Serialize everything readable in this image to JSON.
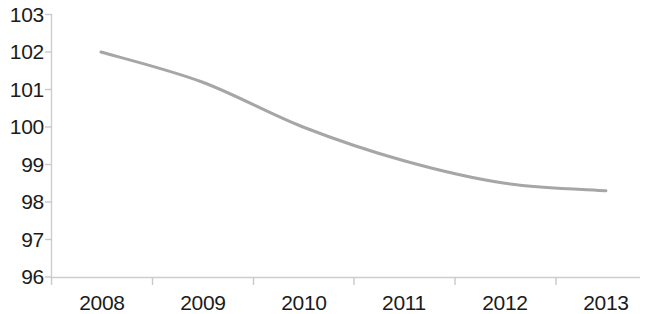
{
  "chart_data": {
    "type": "line",
    "title": "",
    "subtitle": "",
    "xlabel": "",
    "ylabel": "",
    "x": [
      "2008",
      "2009",
      "2010",
      "2011",
      "2012",
      "2013"
    ],
    "categories": [
      "2008",
      "2009",
      "2010",
      "2011",
      "2012",
      "2013"
    ],
    "series": [
      {
        "name": "",
        "values": [
          102.0,
          101.2,
          100.0,
          99.1,
          98.5,
          98.3
        ],
        "color": "#a6a6a6"
      }
    ],
    "values": [
      102.0,
      101.2,
      100.0,
      99.1,
      98.5,
      98.3
    ],
    "xlim": [
      "2008",
      "2013"
    ],
    "ylim": [
      96,
      103
    ],
    "ytick_values": [
      103,
      102,
      101,
      100,
      99,
      98,
      97,
      96
    ],
    "ytick_labels": [
      "103",
      "102",
      "101",
      "100",
      "99",
      "98",
      "97",
      "96"
    ],
    "xtick_labels": [
      "2008",
      "2009",
      "2010",
      "2011",
      "2012",
      "2013"
    ],
    "grid": false,
    "legend": false,
    "legend_position": "none",
    "axis_color": "#c9c9c9",
    "tick_label_color": "#1b1b1b",
    "line_color": "#a6a6a6",
    "line_width": 3,
    "background": "#ffffff"
  },
  "yticks": {
    "t0": "103",
    "t1": "102",
    "t2": "101",
    "t3": "100",
    "t4": "99",
    "t5": "98",
    "t6": "97",
    "t7": "96"
  },
  "xticks": {
    "t0": "2008",
    "t1": "2009",
    "t2": "2010",
    "t3": "2011",
    "t4": "2012",
    "t5": "2013"
  }
}
